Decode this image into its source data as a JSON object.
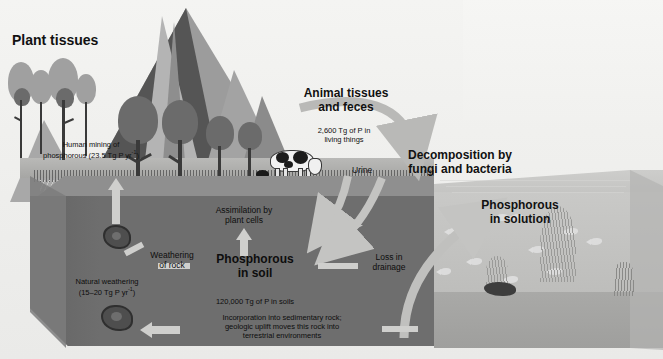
{
  "diagram": {
    "labels": {
      "plant_tissues": "Plant tissues",
      "human_mining_line1": "Human mining of",
      "human_mining_line2": "phosphorous (23.5 Tg P yr",
      "human_mining_sup": "-1",
      "human_mining_close": ")",
      "animal_tissues_line1": "Animal tissues",
      "animal_tissues_line2": "and feces",
      "living_things_line1": "2,600 Tg of P in",
      "living_things_line2": "living things",
      "urine": "Urine",
      "decomposition_line1": "Decomposition by",
      "decomposition_line2": "fungi and bacteria",
      "assimilation_line1": "Assimilation by",
      "assimilation_line2": "plant cells",
      "phosphorous_in_soil_line1": "Phosphorous",
      "phosphorous_in_soil_line2": "in soil",
      "soil_pool": "120,000 Tg of P in soils",
      "weathering_line1": "Weathering",
      "weathering_line2": "of rock",
      "natural_weathering_line1": "Natural weathering",
      "natural_weathering_line2": "(15–20 Tg P yr",
      "natural_weathering_sup": "-1",
      "natural_weathering_close": ")",
      "loss_drainage_line1": "Loss in",
      "loss_drainage_line2": "drainage",
      "sedimentary_line1": "Incorporation into sedimentary rock;",
      "sedimentary_line2": "geologic uplift moves this rock into",
      "sedimentary_line3": "terrestrial environments",
      "phosphorous_in_solution_line1": "Phosphorous",
      "phosphorous_in_solution_line2": "in solution"
    },
    "pools": [
      {
        "name": "living things",
        "value": "2,600 Tg of P in living things"
      },
      {
        "name": "soils",
        "value": "120,000 Tg of P in soils"
      }
    ],
    "fluxes": [
      {
        "name": "human mining of phosphorous",
        "value": "23.5 Tg P yr-1"
      },
      {
        "name": "natural weathering",
        "value": "15–20 Tg P yr-1"
      }
    ],
    "colors": {
      "background": "#f2f2f0",
      "soil": "#6e6e6e",
      "soil_top": "#8f8f8f",
      "water": "#c5c5c3",
      "mountain": "#9c9c9c",
      "arrow": "#cfcfcd",
      "text": "#111111"
    },
    "icons": {
      "tree": "tree-icon",
      "cow": "cow-icon",
      "rock": "rock-icon",
      "fish": "fish-icon",
      "seaweed": "seaweed-icon",
      "mountain": "mountain-icon"
    }
  }
}
